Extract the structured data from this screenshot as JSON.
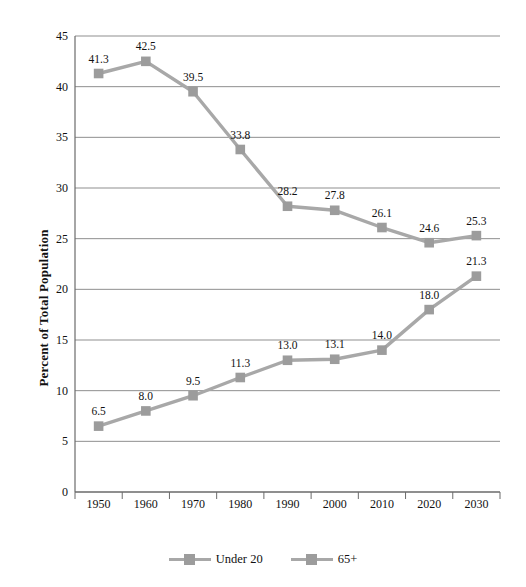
{
  "chart_data": {
    "type": "line",
    "title": "",
    "xlabel": "",
    "ylabel": "Percent of Total Population",
    "categories": [
      "1950",
      "1960",
      "1970",
      "1980",
      "1990",
      "2000",
      "2010",
      "2020",
      "2030"
    ],
    "ylim": [
      0,
      45
    ],
    "y_ticks": [
      "0",
      "5",
      "10",
      "15",
      "20",
      "25",
      "30",
      "35",
      "40",
      "45"
    ],
    "y_tick_values": [
      0,
      5,
      10,
      15,
      20,
      25,
      30,
      35,
      40,
      45
    ],
    "grid": "horizontal",
    "legend_position": "bottom",
    "series": [
      {
        "name": "Under 20",
        "values": [
          41.3,
          42.5,
          39.5,
          33.8,
          28.2,
          27.8,
          26.1,
          24.6,
          25.3
        ],
        "labels": [
          "41.3",
          "42.5",
          "39.5",
          "33.8",
          "28.2",
          "27.8",
          "26.1",
          "24.6",
          "25.3"
        ],
        "color": "#9c9c9c"
      },
      {
        "name": "65+",
        "values": [
          6.5,
          8.0,
          9.5,
          11.3,
          13.0,
          13.1,
          14.0,
          18.0,
          21.3
        ],
        "labels": [
          "6.5",
          "8.0",
          "9.5",
          "11.3",
          "13.0",
          "13.1",
          "14.0",
          "18.0",
          "21.3"
        ],
        "color": "#9c9c9c"
      }
    ]
  },
  "axis": {
    "y_title": "Percent of Total Population"
  },
  "legend": {
    "entries": [
      {
        "label": "Under 20"
      },
      {
        "label": "65+"
      }
    ]
  },
  "colors": {
    "series": "#9c9c9c",
    "line": "#a8a8a8",
    "grid": "#8f8f8f",
    "axis": "#6b6b6b",
    "text": "#111111",
    "background": "#ffffff"
  }
}
